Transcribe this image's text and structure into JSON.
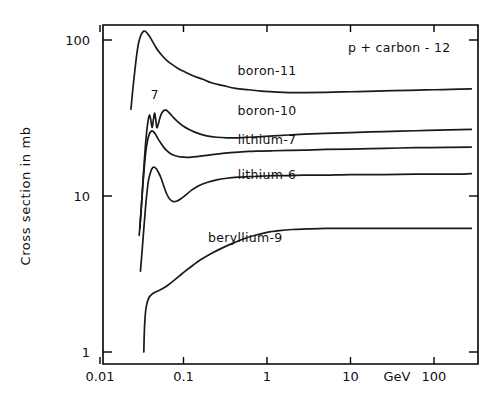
{
  "chart_data": {
    "type": "line",
    "title": "p + carbon - 12",
    "xlabel": "GeV",
    "ylabel": "Cross section in mb",
    "xscale": "log",
    "yscale": "log",
    "xlim": [
      0.008,
      300
    ],
    "ylim": [
      1,
      130
    ],
    "grid": false,
    "legend_position": "inline-right-of-curve",
    "xticks": [
      "0.01",
      "0.1",
      "1",
      "10",
      "100"
    ],
    "xtick_values": [
      0.01,
      0.1,
      1,
      10,
      100
    ],
    "yticks": [
      "1",
      "10",
      "100"
    ],
    "ytick_values": [
      1,
      10,
      100
    ],
    "annotations": [
      {
        "text": "7",
        "x": 0.045,
        "y": 42,
        "name": "resonance-marker-7"
      }
    ],
    "series": [
      {
        "name": "boron-11",
        "label": "boron-11",
        "label_x": 1.0,
        "label_y": 60,
        "x": [
          0.0235,
          0.0245,
          0.026,
          0.0275,
          0.029,
          0.031,
          0.0335,
          0.036,
          0.039,
          0.042,
          0.046,
          0.05,
          0.056,
          0.063,
          0.072,
          0.085,
          0.1,
          0.13,
          0.17,
          0.22,
          0.3,
          0.42,
          0.6,
          0.85,
          1.2,
          1.8,
          2.8,
          5.0,
          10,
          20,
          50,
          100,
          200,
          280
        ],
        "y": [
          36,
          46,
          62,
          80,
          96,
          108,
          114,
          112,
          106,
          99,
          91,
          85,
          79,
          74,
          70,
          66,
          63,
          59,
          56,
          53,
          51,
          49,
          48,
          47,
          46.5,
          46,
          46,
          46.2,
          46.6,
          47,
          47.6,
          48,
          48.4,
          48.6
        ]
      },
      {
        "name": "boron-10",
        "label": "boron-10",
        "label_x": 1.0,
        "label_y": 33,
        "x": [
          0.03,
          0.0315,
          0.033,
          0.0345,
          0.036,
          0.0375,
          0.039,
          0.0405,
          0.042,
          0.0435,
          0.045,
          0.0465,
          0.048,
          0.05,
          0.053,
          0.057,
          0.062,
          0.068,
          0.075,
          0.085,
          0.1,
          0.12,
          0.15,
          0.19,
          0.25,
          0.33,
          0.45,
          0.62,
          0.85,
          1.2,
          1.8,
          2.8,
          5.0,
          10,
          25,
          60,
          150,
          280
        ],
        "y": [
          6.2,
          9.0,
          13.5,
          19.0,
          25.0,
          30.0,
          33.0,
          31.0,
          27.5,
          30.5,
          34.0,
          31.0,
          27.5,
          29.0,
          32.5,
          35.0,
          35.5,
          34.0,
          32.0,
          30.0,
          28.0,
          26.5,
          25.2,
          24.3,
          23.8,
          23.6,
          23.6,
          23.8,
          24.0,
          24.3,
          24.6,
          24.9,
          25.2,
          25.5,
          25.9,
          26.2,
          26.5,
          26.7
        ]
      },
      {
        "name": "lithium-7",
        "label": "lithium-7",
        "label_x": 1.0,
        "label_y": 21.5,
        "x": [
          0.0295,
          0.031,
          0.0325,
          0.034,
          0.0355,
          0.037,
          0.039,
          0.041,
          0.043,
          0.046,
          0.049,
          0.053,
          0.058,
          0.064,
          0.071,
          0.08,
          0.092,
          0.11,
          0.13,
          0.16,
          0.2,
          0.26,
          0.34,
          0.45,
          0.6,
          0.82,
          1.2,
          1.8,
          2.8,
          5.0,
          10,
          25,
          60,
          150,
          280
        ],
        "y": [
          5.6,
          8.0,
          11.5,
          15.5,
          19.5,
          22.5,
          25.0,
          26.0,
          26.0,
          25.0,
          23.5,
          22.0,
          20.5,
          19.4,
          18.6,
          18.1,
          17.8,
          17.7,
          17.8,
          18.0,
          18.3,
          18.6,
          18.9,
          19.1,
          19.3,
          19.4,
          19.5,
          19.6,
          19.7,
          19.9,
          20.0,
          20.2,
          20.4,
          20.5,
          20.6
        ]
      },
      {
        "name": "lithium-6",
        "label": "lithium-6",
        "label_x": 1.0,
        "label_y": 12.8,
        "x": [
          0.0305,
          0.032,
          0.0335,
          0.035,
          0.0365,
          0.038,
          0.04,
          0.042,
          0.044,
          0.047,
          0.05,
          0.054,
          0.058,
          0.063,
          0.069,
          0.076,
          0.084,
          0.093,
          0.105,
          0.125,
          0.15,
          0.19,
          0.25,
          0.33,
          0.45,
          0.62,
          0.85,
          1.2,
          1.8,
          2.8,
          5.0,
          10,
          25,
          60,
          150,
          280
        ],
        "y": [
          3.3,
          4.5,
          6.2,
          8.3,
          10.5,
          12.5,
          14.0,
          15.0,
          15.3,
          15.0,
          14.2,
          13.0,
          11.6,
          10.3,
          9.5,
          9.2,
          9.3,
          9.6,
          10.1,
          10.9,
          11.6,
          12.2,
          12.7,
          13.0,
          13.2,
          13.3,
          13.4,
          13.5,
          13.5,
          13.6,
          13.6,
          13.7,
          13.7,
          13.8,
          13.8,
          13.9
        ]
      },
      {
        "name": "beryllium-9",
        "label": "beryllium-9",
        "label_x": 0.55,
        "label_y": 5.1,
        "x": [
          0.0335,
          0.0338,
          0.0345,
          0.0355,
          0.037,
          0.039,
          0.042,
          0.046,
          0.051,
          0.057,
          0.065,
          0.075,
          0.088,
          0.105,
          0.13,
          0.16,
          0.21,
          0.28,
          0.38,
          0.52,
          0.72,
          1.0,
          1.4,
          2.0,
          3.0,
          5.0,
          10,
          25,
          60,
          150,
          280
        ],
        "y": [
          1.0,
          1.25,
          1.6,
          1.9,
          2.1,
          2.25,
          2.35,
          2.42,
          2.48,
          2.56,
          2.68,
          2.85,
          3.05,
          3.3,
          3.6,
          3.9,
          4.25,
          4.6,
          4.95,
          5.3,
          5.6,
          5.85,
          6.0,
          6.1,
          6.15,
          6.2,
          6.2,
          6.2,
          6.2,
          6.2,
          6.2
        ]
      }
    ]
  },
  "axes": {
    "x_unit_label": "GeV"
  }
}
